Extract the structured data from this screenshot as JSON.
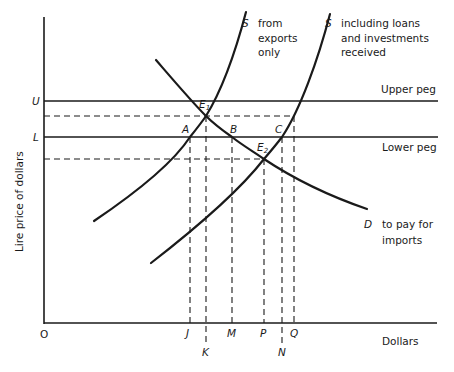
{
  "diagram": {
    "type": "supply-demand foreign exchange diagram with pegged rate band",
    "axes": {
      "y_label": "Lire price of dollars",
      "x_label": "Dollars",
      "origin": "O"
    },
    "price_levels": {
      "upper": {
        "symbol": "U",
        "label": "Upper peg"
      },
      "lower": {
        "symbol": "L",
        "label": "Lower peg"
      }
    },
    "curves": {
      "supply_exports": {
        "symbol": "S",
        "caption_lines": [
          "from",
          "exports",
          "only"
        ]
      },
      "supply_total": {
        "symbol": "S",
        "caption_lines": [
          "including loans",
          "and investments",
          "received"
        ]
      },
      "demand": {
        "symbol": "D",
        "caption_lines": [
          "to pay for",
          "imports"
        ]
      }
    },
    "points": {
      "E1": {
        "letter": "E",
        "sub": "1"
      },
      "E2": {
        "letter": "E",
        "sub": "2"
      },
      "A": "A",
      "B": "B",
      "C": "C"
    },
    "quantity_ticks": {
      "J": "J",
      "K": "K",
      "M": "M",
      "P": "P",
      "N": "N",
      "Q": "Q"
    }
  }
}
